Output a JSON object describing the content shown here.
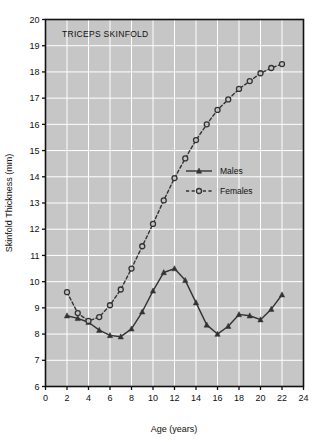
{
  "chart_data": {
    "type": "line",
    "title": "TRICEPS SKINFOLD",
    "xlabel": "Age (years)",
    "ylabel": "Skinfold Thickness (mm)",
    "xlim": [
      0,
      24
    ],
    "ylim": [
      6,
      20
    ],
    "xticks": [
      0,
      2,
      4,
      6,
      8,
      10,
      12,
      14,
      16,
      18,
      20,
      22,
      24
    ],
    "xtick_labels": [
      "0",
      "2",
      "4",
      "6",
      "8",
      "10",
      "12",
      "14",
      "16",
      "18",
      "20",
      "22",
      "24"
    ],
    "yticks": [
      6,
      7,
      8,
      9,
      10,
      11,
      12,
      13,
      14,
      15,
      16,
      17,
      18,
      19,
      20
    ],
    "ytick_labels": [
      "6",
      "7",
      "8",
      "9",
      "10",
      "11",
      "12",
      "13",
      "14",
      "15",
      "16",
      "17",
      "18",
      "19",
      "20"
    ],
    "grid": true,
    "grid_color": "#ffffff",
    "plot_background": "#c6c6c6",
    "legend_position": "center-right",
    "series": [
      {
        "name": "Males",
        "marker": "filled-triangle",
        "linestyle": "solid",
        "color": "#333333",
        "x": [
          2,
          3,
          4,
          5,
          6,
          7,
          8,
          9,
          10,
          11,
          12,
          13,
          14,
          15,
          16,
          17,
          18,
          19,
          20,
          21,
          22
        ],
        "values": [
          8.7,
          8.6,
          8.45,
          8.15,
          7.95,
          7.9,
          8.2,
          8.85,
          9.65,
          10.35,
          10.5,
          10.05,
          9.2,
          8.35,
          8.0,
          8.3,
          8.75,
          8.7,
          8.55,
          8.95,
          9.5
        ]
      },
      {
        "name": "Females",
        "marker": "open-circle",
        "linestyle": "dashed",
        "color": "#333333",
        "x": [
          2,
          3,
          4,
          5,
          6,
          7,
          8,
          9,
          10,
          11,
          12,
          13,
          14,
          15,
          16,
          17,
          18,
          19,
          20,
          21,
          22
        ],
        "values": [
          9.6,
          8.8,
          8.5,
          8.65,
          9.1,
          9.7,
          10.5,
          11.35,
          12.2,
          13.1,
          13.95,
          14.7,
          15.4,
          16.0,
          16.55,
          16.95,
          17.35,
          17.65,
          17.95,
          18.15,
          18.3
        ]
      }
    ],
    "legend": [
      {
        "label": "Males",
        "marker": "filled-triangle",
        "linestyle": "solid"
      },
      {
        "label": "Females",
        "marker": "open-circle",
        "linestyle": "dashed"
      }
    ]
  }
}
